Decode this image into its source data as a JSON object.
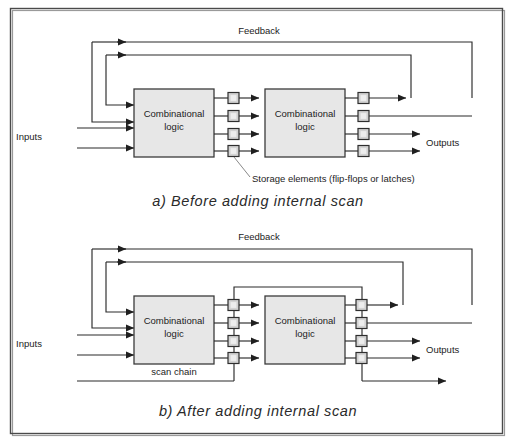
{
  "figure": {
    "background_color": "#ffffff",
    "frame_color": "#4a4a4a",
    "block_fill": "#e7e7e7",
    "storage_fill": "#d3d3d3",
    "wire_color": "#2b2b2b"
  },
  "panel_a": {
    "caption": "a) Before adding internal scan",
    "feedback_label": "Feedback",
    "inputs_label": "Inputs",
    "outputs_label": "Outputs",
    "storage_note": "Storage elements (flip-flops or latches)",
    "block1_line1": "Combinational",
    "block1_line2": "logic",
    "block2_line1": "Combinational",
    "block2_line2": "logic",
    "storage_count_middle": 4,
    "storage_count_right": 4,
    "input_arrow_count": 4,
    "output_arrow_count": 2,
    "feedback_loop_count": 2
  },
  "panel_b": {
    "caption": "b) After adding internal scan",
    "feedback_label": "Feedback",
    "inputs_label": "Inputs",
    "outputs_label": "Outputs",
    "scan_chain_label": "scan chain",
    "block1_line1": "Combinational",
    "block1_line2": "logic",
    "block2_line1": "Combinational",
    "block2_line2": "logic",
    "storage_count_middle": 4,
    "storage_count_right": 4,
    "input_arrow_count": 4,
    "output_arrow_count": 2,
    "feedback_loop_count": 2,
    "scan_chain_present": true
  }
}
